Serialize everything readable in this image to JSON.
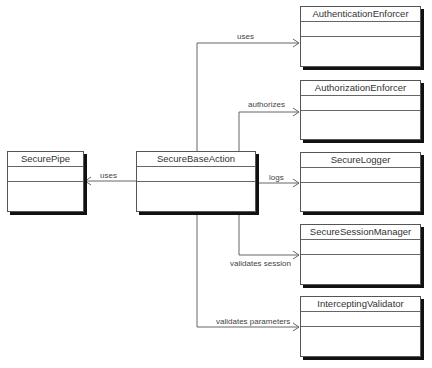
{
  "diagram": {
    "type": "UML class diagram",
    "classes": [
      {
        "id": "secure-pipe",
        "name": "SecurePipe"
      },
      {
        "id": "secure-base-action",
        "name": "SecureBaseAction"
      },
      {
        "id": "authentication-enforcer",
        "name": "AuthenticationEnforcer"
      },
      {
        "id": "authorization-enforcer",
        "name": "AuthorizationEnforcer"
      },
      {
        "id": "secure-logger",
        "name": "SecureLogger"
      },
      {
        "id": "secure-session-manager",
        "name": "SecureSessionManager"
      },
      {
        "id": "intercepting-validator",
        "name": "InterceptingValidator"
      }
    ],
    "relations": [
      {
        "from": "SecureBaseAction",
        "to": "SecurePipe",
        "label": "uses"
      },
      {
        "from": "SecureBaseAction",
        "to": "AuthenticationEnforcer",
        "label": "uses"
      },
      {
        "from": "SecureBaseAction",
        "to": "AuthorizationEnforcer",
        "label": "authorizes"
      },
      {
        "from": "SecureBaseAction",
        "to": "SecureLogger",
        "label": "logs"
      },
      {
        "from": "SecureBaseAction",
        "to": "SecureSessionManager",
        "label": "validates session"
      },
      {
        "from": "SecureBaseAction",
        "to": "InterceptingValidator",
        "label": "validates parameters"
      }
    ]
  }
}
